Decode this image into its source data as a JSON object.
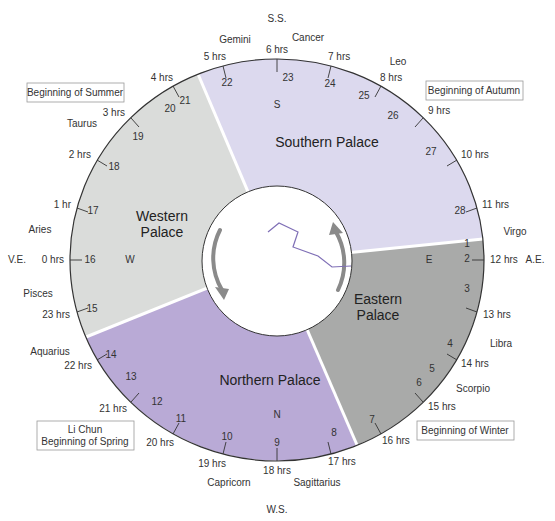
{
  "geometry": {
    "cx": 277,
    "cy": 260,
    "rx": 207,
    "ry": 201,
    "inner_r": 75
  },
  "colors": {
    "southern": "#dcd9ee",
    "western": "#dadcda",
    "northern": "#b9aad6",
    "eastern": "#a9aaa9",
    "divider": "#ffffff",
    "outline": "#333333",
    "arrow": "#8a8a8a",
    "constellation_line": "#7f6fb6",
    "box_border": "#999999"
  },
  "cardinal_labels": {
    "summer_solstice": "S.S.",
    "winter_solstice": "W.S.",
    "vernal_equinox": "V.E.",
    "autumnal_equinox": "A.E."
  },
  "palaces": {
    "southern": {
      "name": "Southern Palace",
      "dir": "S"
    },
    "western": {
      "name_line1": "Western",
      "name_line2": "Palace",
      "dir": "W"
    },
    "northern": {
      "name": "Northern Palace",
      "dir": "N"
    },
    "eastern": {
      "name_line1": "Eastern",
      "name_line2": "Palace",
      "dir": "E"
    }
  },
  "seasons": {
    "summer": "Beginning of Summer",
    "autumn": "Beginning of Autumn",
    "winter": "Beginning of Winter",
    "spring_line1": "Li Chun",
    "spring_line2": "Beginning of Spring"
  },
  "hours": [
    {
      "label": "0 hrs"
    },
    {
      "label": "1 hr"
    },
    {
      "label": "2 hrs"
    },
    {
      "label": "3 hrs"
    },
    {
      "label": "4 hrs"
    },
    {
      "label": "5 hrs"
    },
    {
      "label": "6 hrs"
    },
    {
      "label": "7 hrs"
    },
    {
      "label": "8 hrs"
    },
    {
      "label": "9 hrs"
    },
    {
      "label": "10 hrs"
    },
    {
      "label": "11 hrs"
    },
    {
      "label": "12 hrs"
    },
    {
      "label": "13 hrs"
    },
    {
      "label": "14 hrs"
    },
    {
      "label": "15 hrs"
    },
    {
      "label": "16 hrs"
    },
    {
      "label": "17 hrs"
    },
    {
      "label": "18 hrs"
    },
    {
      "label": "19 hrs"
    },
    {
      "label": "20 hrs"
    },
    {
      "label": "21 hrs"
    },
    {
      "label": "22 hrs"
    },
    {
      "label": "23 hrs"
    }
  ],
  "zodiac": {
    "aries": "Aries",
    "taurus": "Taurus",
    "gemini": "Gemini",
    "cancer": "Cancer",
    "leo": "Leo",
    "virgo": "Virgo",
    "libra": "Libra",
    "scorpio": "Scorpio",
    "sagittarius": "Sagittarius",
    "capricorn": "Capricorn",
    "aquarius": "Aquarius",
    "pisces": "Pisces"
  },
  "mansions": [
    "1",
    "2",
    "3",
    "4",
    "5",
    "6",
    "7",
    "8",
    "9",
    "10",
    "11",
    "12",
    "13",
    "14",
    "15",
    "16",
    "17",
    "18",
    "19",
    "20",
    "21",
    "22",
    "23",
    "24",
    "25",
    "26",
    "27",
    "28"
  ]
}
